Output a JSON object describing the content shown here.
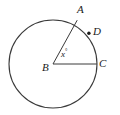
{
  "figure": {
    "type": "circle-with-central-angle",
    "background_color": "#ffffff",
    "stroke_color": "#3a3a3a",
    "text_color": "#1a1a1a",
    "stroke_width": 1,
    "circle": {
      "center_label": "B",
      "center_x": 53,
      "center_y": 64,
      "radius": 44
    },
    "points": [
      {
        "id": "A",
        "label": "A",
        "x": 77,
        "y": 20,
        "on_circle": true,
        "marked_dot": false
      },
      {
        "id": "B",
        "label": "B",
        "x": 53,
        "y": 64,
        "on_circle": false,
        "marked_dot": false
      },
      {
        "id": "C",
        "label": "C",
        "x": 97,
        "y": 64,
        "on_circle": true,
        "marked_dot": false
      },
      {
        "id": "D",
        "label": "D",
        "x": 89,
        "y": 33,
        "on_circle": true,
        "marked_dot": true
      }
    ],
    "segments": [
      {
        "id": "BA",
        "from": "B",
        "to": "A"
      },
      {
        "id": "BC",
        "from": "B",
        "to": "C"
      }
    ],
    "angle": {
      "vertex": "B",
      "label": "x",
      "degree_symbol": "°",
      "full_label": "x°",
      "between": [
        "BA",
        "BC"
      ]
    }
  }
}
